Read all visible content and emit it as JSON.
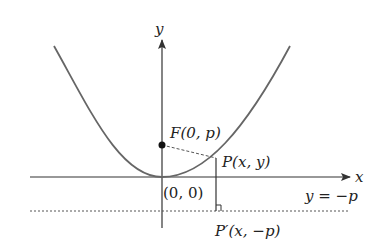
{
  "diagram": {
    "type": "parabola-focus-directrix",
    "axes": {
      "x_label": "x",
      "y_label": "y"
    },
    "labels": {
      "focus": "F(0, p)",
      "point": "P(x, y)",
      "origin": "(0, 0)",
      "directrix": "y = −p",
      "foot": "P′(x, −p)"
    },
    "colors": {
      "curve": "#555555",
      "axis": "#333333",
      "dashed": "#555555"
    }
  }
}
